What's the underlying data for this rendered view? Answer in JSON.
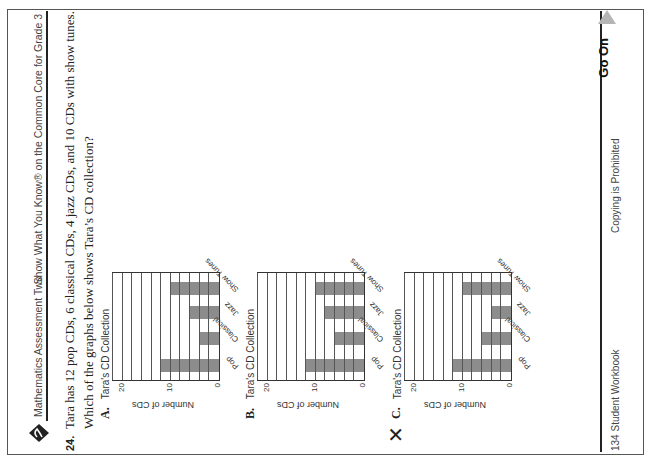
{
  "header": {
    "left": "Mathematics Assessment Two",
    "right": "Show What You Know® on the Common Core for Grade 3"
  },
  "question": {
    "number": "24.",
    "text": "Tara has 12 pop CDs, 6 classical CDs, 4 jazz CDs, and 10 CDs with show tunes.",
    "prompt": "Which of the graphs below shows Tara’s CD collection?"
  },
  "options": [
    {
      "label": "A.",
      "selected": false
    },
    {
      "label": "B.",
      "selected": false
    },
    {
      "label": "C.",
      "selected": true,
      "mark": "✕"
    }
  ],
  "footer": {
    "left": "134 Student Workbook",
    "center": "Copying is Prohibited",
    "go_on": "Go On"
  },
  "chart_data": [
    {
      "type": "bar",
      "option": "A",
      "title": "Tara's CD Collection",
      "categories": [
        "Pop",
        "Classical",
        "Jazz",
        "Show Tunes"
      ],
      "values": [
        12,
        4,
        6,
        10
      ],
      "xlabel": "",
      "ylabel": "Number of CDs",
      "yticks": [
        "0",
        "10",
        "20"
      ],
      "ylim": [
        0,
        22
      ],
      "grid": true,
      "gridline_step": 2
    },
    {
      "type": "bar",
      "option": "B",
      "title": "Tara's CD Collection",
      "categories": [
        "Pop",
        "Classical",
        "Jazz",
        "Show Tunes"
      ],
      "values": [
        12,
        6,
        8,
        10
      ],
      "xlabel": "",
      "ylabel": "Number of CDs",
      "yticks": [
        "0",
        "10",
        "20"
      ],
      "ylim": [
        0,
        22
      ],
      "grid": true,
      "gridline_step": 2
    },
    {
      "type": "bar",
      "option": "C",
      "title": "Tara's CD Collection",
      "categories": [
        "Pop",
        "Classical",
        "Jazz",
        "Show Tunes"
      ],
      "values": [
        12,
        6,
        4,
        10
      ],
      "xlabel": "",
      "ylabel": "Number of CDs",
      "yticks": [
        "0",
        "10",
        "20"
      ],
      "ylim": [
        0,
        22
      ],
      "grid": true,
      "gridline_step": 2
    }
  ],
  "colors": {
    "bar": "#8c8c8c",
    "go_on_arrow": "#b5b5b5"
  }
}
